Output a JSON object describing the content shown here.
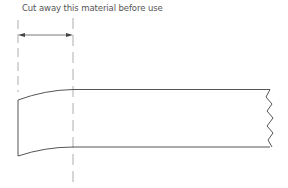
{
  "diagram": {
    "caption": "Cut away this material before use",
    "colors": {
      "stroke": "#555555",
      "dashed": "#999999",
      "text": "#555555",
      "background": "#ffffff"
    },
    "elements": [
      {
        "type": "dimension-arrow",
        "label": "cut-away-width",
        "from_x": 18,
        "to_x": 73,
        "y": 35
      },
      {
        "type": "dashed-guide",
        "side": "left",
        "x": 18
      },
      {
        "type": "dashed-guide",
        "side": "right",
        "x": 73
      },
      {
        "type": "material-bar",
        "end": "broken-wavy",
        "left_end": "tapered-curved"
      }
    ]
  }
}
